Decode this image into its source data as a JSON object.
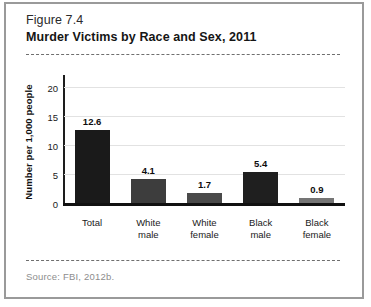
{
  "figure": {
    "label": "Figure 7.4",
    "title": "Murder Victims by Race and Sex, 2011",
    "source": "Source: FBI, 2012b."
  },
  "chart_data": {
    "type": "bar",
    "title": "Murder Victims by Race and Sex, 2011",
    "xlabel": "",
    "ylabel": "Number per 1,000 people",
    "categories": [
      "Total",
      "White male",
      "White female",
      "Black male",
      "Black female"
    ],
    "values": [
      12.6,
      4.1,
      1.7,
      5.4,
      0.9
    ],
    "value_labels": [
      "12.6",
      "4.1",
      "1.7",
      "5.4",
      "0.9"
    ],
    "category_lines": [
      [
        "Total"
      ],
      [
        "White",
        "male"
      ],
      [
        "White",
        "female"
      ],
      [
        "Black",
        "male"
      ],
      [
        "Black",
        "female"
      ]
    ],
    "bar_colors": [
      "#1a1a1a",
      "#3d3d3d",
      "#4a4a4a",
      "#1f1f1f",
      "#757575"
    ],
    "ylim": [
      0,
      22
    ],
    "yticks": [
      0,
      5,
      10,
      15,
      20
    ],
    "ytick_labels": [
      "0",
      "5",
      "10",
      "15",
      "20"
    ],
    "grid": true,
    "legend": "none"
  }
}
